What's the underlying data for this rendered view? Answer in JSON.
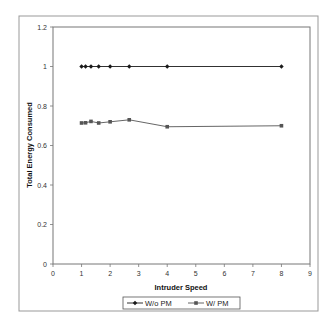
{
  "chart_data": {
    "type": "line",
    "title": "",
    "xlabel": "Intruder Speed",
    "ylabel": "Total Energy Consumed",
    "xlim": [
      0,
      9
    ],
    "ylim": [
      0,
      1.2
    ],
    "x_ticks": [
      "0",
      "1",
      "2",
      "3",
      "4",
      "5",
      "6",
      "7",
      "8",
      "9"
    ],
    "y_ticks": [
      "0",
      "0.2",
      "0.4",
      "0.6",
      "0.8",
      "1",
      "1.2"
    ],
    "grid": false,
    "legend_position": "bottom",
    "x": [
      1,
      1.14,
      1.33,
      1.6,
      2,
      2.67,
      4,
      8
    ],
    "series": [
      {
        "name": "W/o PM",
        "marker": "diamond",
        "color": "#1a1a1a",
        "values": [
          1,
          1,
          1,
          1,
          1,
          1,
          1,
          1
        ]
      },
      {
        "name": "W/ PM",
        "marker": "square",
        "color": "#555555",
        "values": [
          0.714,
          0.715,
          0.722,
          0.714,
          0.72,
          0.73,
          0.695,
          0.7
        ]
      }
    ]
  }
}
